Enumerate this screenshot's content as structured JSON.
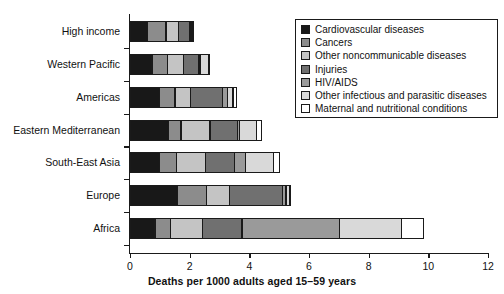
{
  "chart_data": {
    "type": "bar",
    "orientation": "horizontal",
    "stacked": true,
    "title": "",
    "xlabel": "Deaths per 1000 adults aged 15–59 years",
    "ylabel": "",
    "xlim": [
      0,
      12
    ],
    "xticks": [
      0,
      2,
      4,
      6,
      8,
      10,
      12
    ],
    "grid": false,
    "legend_position": "top-right",
    "categories": [
      "High income",
      "Western Pacific",
      "Americas",
      "Eastern Mediterranean",
      "South-East Asia",
      "Europe",
      "Africa"
    ],
    "series": [
      {
        "name": "Cardiovascular diseases",
        "color": "#181818",
        "values": [
          0.6,
          0.75,
          1.0,
          1.3,
          1.0,
          1.6,
          0.85
        ]
      },
      {
        "name": "Cancers",
        "color": "#8c8c8c",
        "values": [
          0.65,
          0.55,
          0.55,
          0.45,
          0.6,
          1.0,
          0.55
        ]
      },
      {
        "name": "Other noncommunicable diseases",
        "color": "#c4c4c4",
        "values": [
          0.45,
          0.55,
          0.55,
          1.0,
          1.0,
          0.8,
          1.1
        ]
      },
      {
        "name": "Injuries",
        "color": "#707070",
        "values": [
          0.4,
          0.55,
          1.1,
          0.95,
          1.0,
          1.8,
          1.35
        ]
      },
      {
        "name": "HIV/AIDS",
        "color": "#9a9a9a",
        "values": [
          0.03,
          0.05,
          0.2,
          0.1,
          0.4,
          0.15,
          3.3
        ]
      },
      {
        "name": "Other infectious and parasitic diseases",
        "color": "#d9d9d9",
        "values": [
          0.05,
          0.3,
          0.2,
          0.6,
          0.95,
          0.15,
          2.1
        ]
      },
      {
        "name": "Maternal and nutritional conditions",
        "color": "#ffffff",
        "values": [
          0.02,
          0.05,
          0.15,
          0.2,
          0.25,
          0.05,
          0.75
        ]
      }
    ],
    "totals": [
      2.2,
      2.8,
      3.75,
      4.6,
      5.2,
      5.55,
      10.0
    ]
  },
  "legend": {
    "entries": [
      "Cardiovascular diseases",
      "Cancers",
      "Other noncommunicable diseases",
      "Injuries",
      "HIV/AIDS",
      "Other infectious and parasitic diseases",
      "Maternal and nutritional conditions"
    ]
  },
  "axis": {
    "tick_labels": [
      "0",
      "2",
      "4",
      "6",
      "8",
      "10",
      "12"
    ],
    "x_title": "Deaths per 1000 adults aged 15–59 years"
  }
}
